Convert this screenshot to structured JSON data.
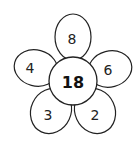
{
  "diagram": {
    "type": "number-flower",
    "center": {
      "value": "18"
    },
    "petals": [
      {
        "position": "top",
        "value": "8"
      },
      {
        "position": "left",
        "value": "4"
      },
      {
        "position": "right",
        "value": "6"
      },
      {
        "position": "bottom-left",
        "value": "3"
      },
      {
        "position": "bottom-right",
        "value": "2"
      }
    ],
    "colors": {
      "stroke": "#222222",
      "fill": "#ffffff"
    }
  }
}
